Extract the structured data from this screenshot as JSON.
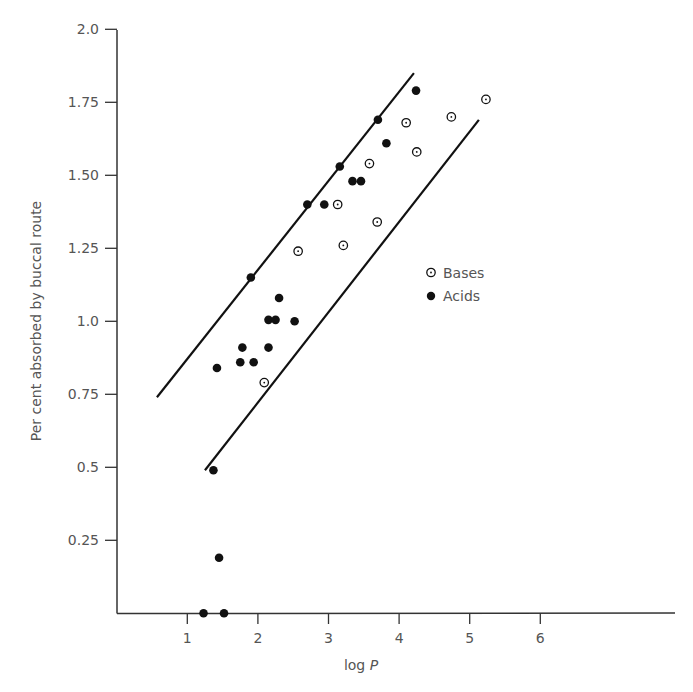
{
  "chart_data": {
    "type": "scatter",
    "title": "",
    "xlabel": "log P",
    "xlabel_parts": {
      "text": "log ",
      "italic": "P"
    },
    "ylabel": "Per cent absorbed by buccal route",
    "xlim": [
      0,
      7.9
    ],
    "ylim": [
      0,
      2.0
    ],
    "x_ticks": [
      1,
      2,
      3,
      4,
      5,
      6
    ],
    "x_tick_labels": [
      "1",
      "2",
      "3",
      "4",
      "5",
      "6"
    ],
    "y_ticks": [
      0.25,
      0.5,
      0.75,
      1.0,
      1.25,
      1.5,
      1.75,
      2.0
    ],
    "y_tick_labels": [
      "0.25",
      "0.5",
      "0.75",
      "1.0",
      "1.25",
      "1.50",
      "1.75",
      "2.0"
    ],
    "grid": false,
    "legend_position": "inside-right",
    "series": [
      {
        "name": "Bases",
        "marker": "open-circle",
        "points": [
          [
            2.09,
            0.79
          ],
          [
            2.57,
            1.24
          ],
          [
            3.21,
            1.26
          ],
          [
            3.13,
            1.4
          ],
          [
            3.69,
            1.34
          ],
          [
            3.58,
            1.54
          ],
          [
            4.25,
            1.58
          ],
          [
            4.1,
            1.68
          ],
          [
            4.74,
            1.7
          ],
          [
            5.23,
            1.76
          ]
        ]
      },
      {
        "name": "Acids",
        "marker": "filled-circle",
        "points": [
          [
            1.23,
            0.0
          ],
          [
            1.52,
            0.0
          ],
          [
            1.45,
            0.19
          ],
          [
            1.37,
            0.49
          ],
          [
            1.42,
            0.84
          ],
          [
            1.75,
            0.86
          ],
          [
            1.94,
            0.86
          ],
          [
            1.78,
            0.91
          ],
          [
            2.15,
            0.91
          ],
          [
            2.52,
            1.0
          ],
          [
            2.15,
            1.005
          ],
          [
            2.25,
            1.005
          ],
          [
            2.3,
            1.08
          ],
          [
            1.9,
            1.15
          ],
          [
            2.7,
            1.4
          ],
          [
            2.94,
            1.4
          ],
          [
            3.34,
            1.48
          ],
          [
            3.46,
            1.48
          ],
          [
            3.16,
            1.53
          ],
          [
            3.82,
            1.61
          ],
          [
            3.7,
            1.69
          ],
          [
            4.24,
            1.79
          ]
        ]
      }
    ],
    "lines": [
      {
        "name": "upper-boundary",
        "from": [
          0.57,
          0.74
        ],
        "to": [
          4.21,
          1.85
        ]
      },
      {
        "name": "lower-boundary",
        "from": [
          1.25,
          0.49
        ],
        "to": [
          5.13,
          1.69
        ]
      }
    ],
    "legend": [
      {
        "label": "Bases",
        "marker": "open-circle"
      },
      {
        "label": "Acids",
        "marker": "filled-circle"
      }
    ],
    "colors": {
      "marker": "#111111",
      "axis": "#333333",
      "text": "#555555",
      "background": "#ffffff"
    }
  }
}
